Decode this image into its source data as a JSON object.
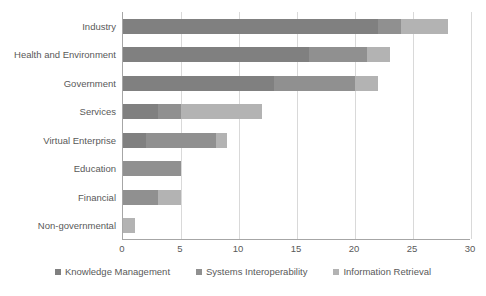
{
  "chart_data": {
    "type": "bar",
    "orientation": "horizontal",
    "stacked": true,
    "title": "",
    "xlabel": "",
    "ylabel": "",
    "xlim": [
      0,
      30
    ],
    "xticks": [
      0,
      5,
      10,
      15,
      20,
      25,
      30
    ],
    "grid": true,
    "legend_position": "bottom",
    "categories": [
      "Industry",
      "Health and Environment",
      "Government",
      "Services",
      "Virtual Enterprise",
      "Education",
      "Financial",
      "Non-governmental"
    ],
    "series": [
      {
        "name": "Knowledge Management",
        "color": "#808080",
        "values": [
          22,
          16,
          13,
          3,
          2,
          0,
          0,
          0
        ]
      },
      {
        "name": "Systems Interoperability",
        "color": "#909090",
        "values": [
          2,
          5,
          7,
          2,
          6,
          5,
          3,
          0
        ]
      },
      {
        "name": "Information Retrieval",
        "color": "#b3b3b3",
        "values": [
          4,
          2,
          2,
          7,
          1,
          0,
          2,
          1
        ]
      }
    ],
    "totals": [
      28,
      23,
      22,
      12,
      9,
      5,
      5,
      1
    ]
  },
  "colors": {
    "axis": "#a6a6a6",
    "gridline": "#d9d9d9",
    "text": "#595959",
    "background": "#ffffff"
  }
}
